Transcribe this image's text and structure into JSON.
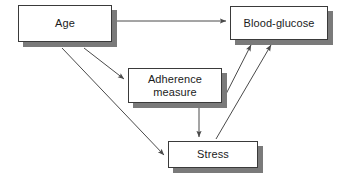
{
  "diagram": {
    "type": "path-model",
    "title": "",
    "background_color": "#ffffff",
    "box_fill_color": "#ffffff",
    "box_border_color": "#3a3a3a",
    "box_shadow_color": "#7a7a7a",
    "arrow_color": "#4a4a4a",
    "text_color": "#1b1b1b",
    "nodes": [
      {
        "id": "age",
        "label": "Age",
        "x": 18,
        "y": 5,
        "width": 94,
        "height": 37
      },
      {
        "id": "blood_glucose",
        "label": "Blood-glucose",
        "x": 230,
        "y": 6,
        "width": 98,
        "height": 34
      },
      {
        "id": "adherence_measure",
        "label": "Adherence\nmeasure",
        "x": 128,
        "y": 68,
        "width": 94,
        "height": 35
      },
      {
        "id": "stress",
        "label": "Stress",
        "x": 168,
        "y": 141,
        "width": 90,
        "height": 27
      }
    ],
    "edges": [
      {
        "id": "age-to-blood-glucose",
        "from": "age",
        "to": "blood_glucose",
        "x1": 116,
        "y1": 21,
        "x2": 228,
        "y2": 21
      },
      {
        "id": "age-to-adherence",
        "from": "age",
        "to": "adherence_measure",
        "x1": 84,
        "y1": 48,
        "x2": 126,
        "y2": 81
      },
      {
        "id": "age-to-stress",
        "from": "age",
        "to": "stress",
        "x1": 62,
        "y1": 48,
        "x2": 166,
        "y2": 157
      },
      {
        "id": "adherence-to-stress",
        "from": "adherence_measure",
        "to": "stress",
        "x1": 199,
        "y1": 108,
        "x2": 199,
        "y2": 139
      },
      {
        "id": "adherence-to-blood-glucose",
        "from": "adherence_measure",
        "to": "blood_glucose",
        "x1": 224,
        "y1": 98,
        "x2": 250,
        "y2": 47
      },
      {
        "id": "stress-to-blood-glucose",
        "from": "stress",
        "to": "blood_glucose",
        "x1": 216,
        "y1": 139,
        "x2": 270,
        "y2": 47
      }
    ]
  }
}
